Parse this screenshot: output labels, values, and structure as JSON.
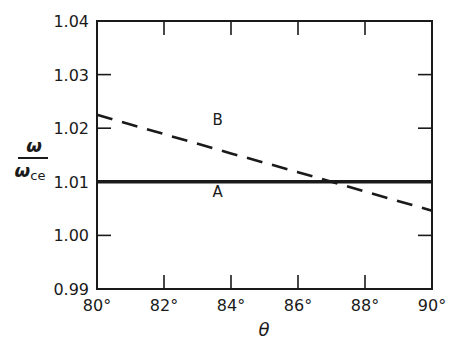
{
  "chart_data": {
    "type": "line",
    "title": "",
    "xlabel": "θ",
    "ylabel": "ω / ω_ce",
    "ylabel_numerator": "ω",
    "ylabel_denominator": "ω",
    "ylabel_subscript": "ce",
    "xlim": [
      80,
      90
    ],
    "ylim": [
      0.99,
      1.04
    ],
    "x_ticks": [
      80,
      82,
      84,
      86,
      88,
      90
    ],
    "x_tick_labels": [
      "80°",
      "82°",
      "84°",
      "86°",
      "88°",
      "90°"
    ],
    "y_ticks": [
      0.99,
      1.0,
      1.01,
      1.02,
      1.03,
      1.04
    ],
    "y_tick_labels": [
      "0.99",
      "1.00",
      "1.01",
      "1.02",
      "1.03",
      "1.04"
    ],
    "grid": false,
    "legend": "none (inline labels)",
    "series": [
      {
        "name": "A",
        "style": "solid-thick",
        "x": [
          80,
          82,
          84,
          86,
          88,
          90
        ],
        "values": [
          1.01,
          1.01,
          1.01,
          1.01,
          1.01,
          1.01
        ],
        "label_pos": [
          83.6,
          1.0082
        ]
      },
      {
        "name": "B",
        "style": "dashed",
        "x": [
          80,
          82,
          84,
          86,
          88,
          90
        ],
        "values": [
          1.0225,
          1.0189,
          1.0153,
          1.0118,
          1.0082,
          1.0046
        ],
        "label_pos": [
          83.6,
          1.0218
        ]
      }
    ],
    "annotations": [
      "A",
      "B"
    ]
  },
  "colors": {
    "ink": "#1a1a1a",
    "background": "#ffffff"
  }
}
